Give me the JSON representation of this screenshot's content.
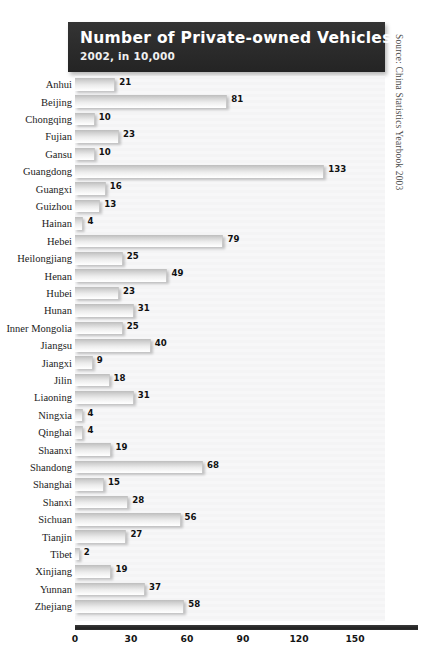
{
  "title": {
    "main": "Number of Private-owned Vehicles",
    "subtitle": "2002, in 10,000"
  },
  "source_note": "Source: China Statistics Yearbook 2003",
  "axis": {
    "ticks": [
      "0",
      "30",
      "60",
      "90",
      "120",
      "150"
    ]
  },
  "chart_data": {
    "type": "bar",
    "orientation": "horizontal",
    "title": "Number of Private-owned Vehicles",
    "subtitle": "2002, in 10,000",
    "xlabel": "",
    "ylabel": "",
    "xlim": [
      0,
      180
    ],
    "xticks": [
      0,
      30,
      60,
      90,
      120,
      150
    ],
    "grid": false,
    "legend": "none",
    "units": "10,000 vehicles",
    "source": "China Statistics Yearbook 2003",
    "categories": [
      "Anhui",
      "Beijing",
      "Chongqing",
      "Fujian",
      "Gansu",
      "Guangdong",
      "Guangxi",
      "Guizhou",
      "Hainan",
      "Hebei",
      "Heilongjiang",
      "Henan",
      "Hubei",
      "Hunan",
      "Inner Mongolia",
      "Jiangsu",
      "Jiangxi",
      "Jilin",
      "Liaoning",
      "Ningxia",
      "Qinghai",
      "Shaanxi",
      "Shandong",
      "Shanghai",
      "Shanxi",
      "Sichuan",
      "Tianjin",
      "Tibet",
      "Xinjiang",
      "Yunnan",
      "Zhejiang"
    ],
    "values": [
      21,
      81,
      10,
      23,
      10,
      133,
      16,
      13,
      4,
      79,
      25,
      49,
      23,
      31,
      25,
      40,
      9,
      18,
      31,
      4,
      4,
      19,
      68,
      15,
      28,
      56,
      27,
      2,
      19,
      37,
      58
    ]
  }
}
